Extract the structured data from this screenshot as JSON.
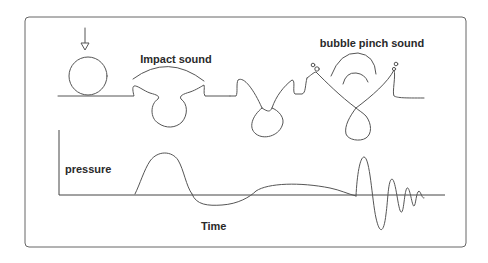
{
  "diagram": {
    "labels": {
      "impact": "Impact sound",
      "bubble_pinch": "bubble pinch sound",
      "y_axis": "pressure",
      "x_axis": "Time"
    },
    "stages": [
      {
        "name": "droplet-falling",
        "description": "Drop approaching the water surface"
      },
      {
        "name": "impact-crater",
        "description": "Drop impact forms a crater"
      },
      {
        "name": "crater-pinching",
        "description": "Crater walls close in"
      },
      {
        "name": "bubble-pinch-off",
        "description": "Bubble pinches off, emitting sound"
      }
    ],
    "waveform": {
      "segments": [
        "impact pulse",
        "low-frequency swell",
        "damped bubble oscillation"
      ]
    }
  }
}
